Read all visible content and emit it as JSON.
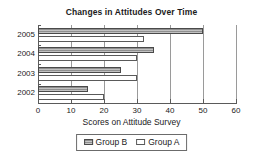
{
  "chart_data": {
    "type": "bar",
    "orientation": "horizontal",
    "title": "Changes in Attitudes Over Time",
    "xlabel": "Scores on Attitude Survey",
    "ylabel": "",
    "categories": [
      "2005",
      "2004",
      "2003",
      "2002"
    ],
    "series": [
      {
        "name": "Group B",
        "values": [
          50,
          35,
          25,
          15
        ],
        "color": "#8f8f8f",
        "pattern": "hatched"
      },
      {
        "name": "Group A",
        "values": [
          32,
          30,
          30,
          20
        ],
        "color": "#ffffff",
        "pattern": "solid"
      }
    ],
    "xlim": [
      0,
      60
    ],
    "xticks": [
      0,
      10,
      20,
      30,
      40,
      50,
      60
    ],
    "xtick_labels": [
      "0",
      "10",
      "20",
      "30",
      "40",
      "50",
      "60"
    ],
    "grid": "vertical",
    "legend_position": "bottom-center",
    "legend_entries": [
      "Group B",
      "Group A"
    ]
  }
}
